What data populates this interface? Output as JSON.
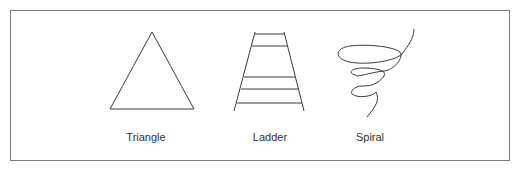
{
  "figures": [
    {
      "id": "triangle",
      "label": "Triangle",
      "icon": "triangle-icon"
    },
    {
      "id": "ladder",
      "label": "Ladder",
      "icon": "ladder-icon"
    },
    {
      "id": "spiral",
      "label": "Spiral",
      "icon": "spiral-icon"
    }
  ],
  "colors": {
    "stroke": "#3a3a3a",
    "frame": "#7a7a7a",
    "text": "#333333"
  }
}
